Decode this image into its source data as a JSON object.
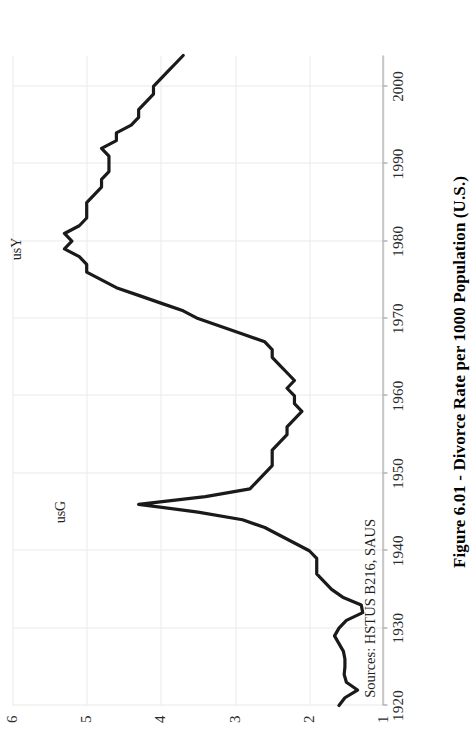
{
  "figure": {
    "title": "Figure 6.01 - Divorce Rate per 1000 Population (U.S.)",
    "source_note": "Sources: HSTUS B216, SAUS",
    "orientation": "rotated-90-ccw",
    "line_color": "#1a1a1a",
    "grid_color": "#e9e9e9",
    "axis_color": "#9a9a9a"
  },
  "annotations": [
    {
      "label": "usG",
      "x": 1945,
      "y": 5.35
    },
    {
      "label": "usY",
      "x": 1979,
      "y": 5.95
    }
  ],
  "chart_data": {
    "type": "line",
    "title": "Figure 6.01 - Divorce Rate per 1000 Population (U.S.)",
    "xlabel": "",
    "ylabel": "",
    "xlim": [
      1920,
      2004
    ],
    "ylim": [
      1,
      6
    ],
    "grid": true,
    "legend": null,
    "xticks": [
      1920,
      1930,
      1940,
      1950,
      1960,
      1970,
      1980,
      1990,
      2000
    ],
    "yticks": [
      1,
      2,
      3,
      4,
      5,
      6
    ],
    "x": [
      1920,
      1921,
      1922,
      1923,
      1924,
      1925,
      1926,
      1927,
      1928,
      1929,
      1930,
      1931,
      1932,
      1933,
      1934,
      1935,
      1936,
      1937,
      1938,
      1939,
      1940,
      1941,
      1942,
      1943,
      1944,
      1945,
      1946,
      1947,
      1948,
      1949,
      1950,
      1951,
      1952,
      1953,
      1954,
      1955,
      1956,
      1957,
      1958,
      1959,
      1960,
      1961,
      1962,
      1963,
      1964,
      1965,
      1966,
      1967,
      1968,
      1969,
      1970,
      1971,
      1972,
      1973,
      1974,
      1975,
      1976,
      1977,
      1978,
      1979,
      1980,
      1981,
      1982,
      1983,
      1984,
      1985,
      1986,
      1987,
      1988,
      1989,
      1990,
      1991,
      1992,
      1993,
      1994,
      1995,
      1996,
      1997,
      1998,
      1999,
      2000,
      2001,
      2002,
      2003,
      2004
    ],
    "values": [
      1.6,
      1.52,
      1.35,
      1.5,
      1.53,
      1.52,
      1.52,
      1.54,
      1.6,
      1.66,
      1.6,
      1.5,
      1.28,
      1.3,
      1.55,
      1.7,
      1.8,
      1.9,
      1.9,
      1.9,
      2.0,
      2.2,
      2.4,
      2.6,
      2.9,
      3.5,
      4.3,
      3.4,
      2.8,
      2.7,
      2.6,
      2.5,
      2.5,
      2.5,
      2.4,
      2.3,
      2.3,
      2.2,
      2.1,
      2.2,
      2.2,
      2.3,
      2.2,
      2.3,
      2.4,
      2.5,
      2.5,
      2.6,
      2.9,
      3.2,
      3.5,
      3.7,
      4.0,
      4.3,
      4.6,
      4.8,
      5.0,
      5.0,
      5.1,
      5.3,
      5.2,
      5.3,
      5.1,
      5.0,
      5.0,
      5.0,
      4.9,
      4.8,
      4.8,
      4.7,
      4.7,
      4.7,
      4.8,
      4.6,
      4.6,
      4.4,
      4.3,
      4.3,
      4.2,
      4.1,
      4.1,
      4.0,
      3.9,
      3.8,
      3.7
    ]
  }
}
